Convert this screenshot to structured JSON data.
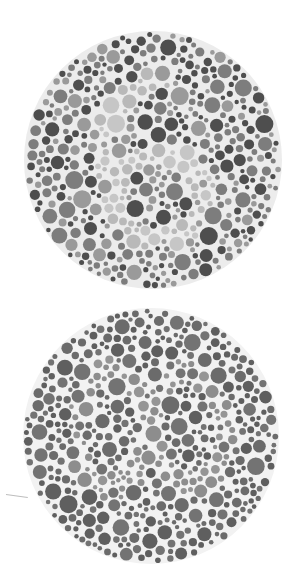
{
  "plates": [
    {
      "id": "plate-top",
      "hidden_figure": "6",
      "cx": 153,
      "cy": 160,
      "r": 129,
      "colors": {
        "background_gap": "#ececec",
        "field_dark": "#4e4e4e",
        "field_mid": "#7d7d7d",
        "field_light": "#9a9a9a",
        "figure": "#b9b9b9",
        "figure_alt": "#c6c6c6"
      }
    },
    {
      "id": "plate-bottom",
      "hidden_figure": "",
      "cx": 151,
      "cy": 436,
      "r": 128,
      "colors": {
        "background_gap": "#f2f2f2",
        "field_dark": "#5f5f5f",
        "field_mid": "#6b6b6b",
        "field_light": "#737373",
        "figure": "#8d8d8d",
        "figure_alt": "#959595"
      }
    }
  ]
}
